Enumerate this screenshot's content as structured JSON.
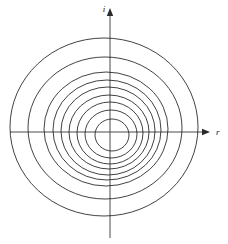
{
  "figure": {
    "background_color": "#ffffff",
    "curve_color": "#221f1f",
    "axis_color": "#4a4a4a",
    "label_color": "#1a1a1a",
    "width": 228,
    "height": 244
  },
  "axes": {
    "horizontal": {
      "label": "r",
      "name": "r-axis",
      "arrow": "right-arrow",
      "x_start": 10,
      "x_end": 210,
      "y": 132,
      "label_x": 216,
      "label_y": 135
    },
    "vertical": {
      "label": "i",
      "name": "i-axis",
      "arrow": "up-arrow",
      "y_start": 8,
      "y_end": 238,
      "x": 110,
      "label_x": 104,
      "label_y": 12
    },
    "origin": {
      "x": 110,
      "y": 132
    }
  },
  "chart_data": {
    "type": "line",
    "title": "",
    "xlabel": "r",
    "ylabel": "i",
    "grid": false,
    "legend": null,
    "xlim": [
      -110,
      118
    ],
    "ylim": [
      -106,
      132
    ],
    "series": [
      {
        "name": "contour-1",
        "cx": 112,
        "cy": 135,
        "rx": 17,
        "ry": 16,
        "rotation": 0
      },
      {
        "name": "contour-2",
        "cx": 111,
        "cy": 134,
        "rx": 26,
        "ry": 24,
        "rotation": 0
      },
      {
        "name": "contour-3",
        "cx": 110,
        "cy": 133,
        "rx": 33,
        "ry": 31,
        "rotation": 0
      },
      {
        "name": "contour-4",
        "cx": 109,
        "cy": 132,
        "rx": 40,
        "ry": 37,
        "rotation": 0
      },
      {
        "name": "contour-5",
        "cx": 108,
        "cy": 131,
        "rx": 47,
        "ry": 44,
        "rotation": 0
      },
      {
        "name": "contour-6",
        "cx": 107,
        "cy": 130,
        "rx": 54,
        "ry": 50,
        "rotation": 0
      },
      {
        "name": "contour-7",
        "cx": 106,
        "cy": 129,
        "rx": 62,
        "ry": 57,
        "rotation": 0
      },
      {
        "name": "contour-8",
        "cx": 105,
        "cy": 128,
        "rx": 77,
        "ry": 71,
        "rotation": 0
      },
      {
        "name": "contour-9",
        "cx": 104,
        "cy": 127,
        "rx": 94,
        "ry": 89,
        "rotation": 0
      }
    ],
    "contour_count": 9
  }
}
